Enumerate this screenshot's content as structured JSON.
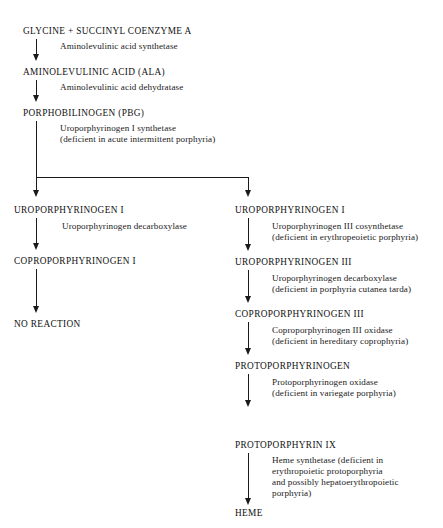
{
  "diagram": {
    "ink_color": "#1a1a1a",
    "background_color": "#ffffff",
    "main_chain": [
      {
        "label": "GLYCINE + SUCCINYL COENZYME A"
      },
      {
        "label": "AMINOLEVULINIC ACID (ALA)"
      },
      {
        "label": "PORPHOBILINOGEN (PBG)"
      }
    ],
    "main_enzymes": [
      {
        "lines": [
          "Aminolevulinic acid synthetase"
        ]
      },
      {
        "lines": [
          "Aminolevulinic acid dehydratase"
        ]
      },
      {
        "lines": [
          "Uroporphyrinogen I synthetase",
          "(deficient in acute intermittent porphyria)"
        ]
      }
    ],
    "left_branch": {
      "nodes": [
        {
          "label": "UROPORPHYRINOGEN I"
        },
        {
          "label": "COPROPORPHYRINOGEN I"
        },
        {
          "label": "NO REACTION"
        }
      ],
      "enzymes": [
        {
          "lines": [
            "Uroporphyrinogen decarboxylase"
          ]
        },
        {
          "lines": []
        }
      ]
    },
    "right_branch": {
      "nodes": [
        {
          "label": "UROPORPHYRINOGEN I"
        },
        {
          "label": "UROPORPHYRINOGEN III"
        },
        {
          "label": "COPROPORPHYRINOGEN III"
        },
        {
          "label": "PROTOPORPHYRINOGEN"
        },
        {
          "label": "PROTOPORPHYRIN IX"
        },
        {
          "label": "HEME"
        }
      ],
      "enzymes": [
        {
          "lines": [
            "Uroporphyrinogen III cosynthetase",
            "(deficient in erythropeoietic porphyria)"
          ]
        },
        {
          "lines": [
            "Uroporphyrinogen decarboxylase",
            "(deficient in porphyria cutanea tarda)"
          ]
        },
        {
          "lines": [
            "Coproporphyrinogen III oxidase",
            "(deficient in hereditary coprophyria)"
          ]
        },
        {
          "lines": [
            "Protoporphyrinogen oxidase",
            "(deficient in variegate porphyria)"
          ]
        },
        {
          "lines": [
            "Heme synthetase (deficient in",
            "erythropoietic protoporphyria",
            "and possibly hepatoerythropoietic",
            "porphyria)"
          ]
        }
      ]
    }
  }
}
